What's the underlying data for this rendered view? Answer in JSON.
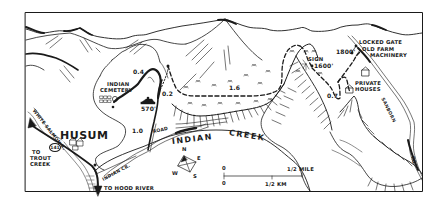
{
  "map": {
    "town": "HUSUM",
    "creek": {
      "word1": "INDIAN",
      "word2": "CREEK"
    },
    "roads": {
      "road_label": "ROAD",
      "indian_cr_label": "INDIAN CR.",
      "white_salmon_label": "WHITE SALMON R.",
      "sanborn_label": "SANBORN",
      "sanborn_rd_label": "RD",
      "highway_shield": "141"
    },
    "destinations": {
      "trout_creek_line1": "TO",
      "trout_creek_line2": "TROUT",
      "trout_creek_line3": "CREEK",
      "hood_river": "TO HOOD RIVER"
    },
    "landmarks": {
      "cemetery_line1": "INDIAN",
      "cemetery_line2": "CEMETERY",
      "locked_gate": "LOCKED GATE",
      "farm_line1": "OLD FARM",
      "farm_line2": "MACHINERY",
      "houses_line1": "PRIVATE",
      "houses_line2": "HOUSES",
      "sign": "SIGN"
    },
    "elevations": {
      "trailhead": "570'",
      "sign": "1600'",
      "gate": "1800'"
    },
    "segment_distances": {
      "upper_loop": "0.4",
      "spur": "0.2",
      "main_trail": "1.6",
      "descent": "0.7",
      "road_segment": "1.0"
    },
    "compass": {
      "n": "N",
      "e": "E",
      "s": "S",
      "w": "W"
    },
    "scale": {
      "zero_top": "0",
      "zero_bottom": "0",
      "mile": "1/2 MILE",
      "km": "1/2 KM"
    },
    "colors": {
      "ink": "#1a1a1a",
      "paper": "#ffffff"
    }
  }
}
